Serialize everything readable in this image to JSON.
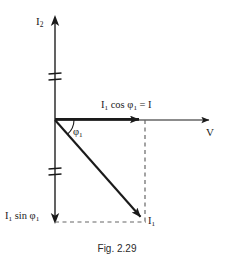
{
  "figure": {
    "caption": "Fig. 2.29",
    "background_color": "#ffffff",
    "line_color": "#1a1a1a",
    "dash_color": "#555555",
    "width": 234,
    "height": 268
  },
  "axes": {
    "vertical": {
      "label": "I₂",
      "label_base": "I",
      "label_sub": "2",
      "name": "current-axis",
      "origin_x": 55,
      "top_y": 17,
      "bottom_y": 222,
      "has_up_arrow": true,
      "has_down_arrow": true,
      "break_marks": [
        74,
        79,
        168,
        174
      ]
    },
    "horizontal": {
      "label": "V",
      "name": "voltage-axis",
      "origin_x": 55,
      "origin_y": 120,
      "end_x": 212,
      "has_arrow": true
    }
  },
  "vectors": [
    {
      "name": "i1-cos-phi1-component",
      "label_base": "I",
      "label_sub": "1",
      "label": "I₁ cos φ₁ = I",
      "from": [
        55,
        120
      ],
      "to": [
        145,
        120
      ]
    },
    {
      "name": "i1-phasor",
      "label_base": "I",
      "label_sub": "1",
      "label": "I₁",
      "from": [
        55,
        120
      ],
      "to": [
        145,
        222
      ]
    }
  ],
  "labels": {
    "i2_axis": "I",
    "i2_axis_sub": "2",
    "v_axis": "V",
    "i1_cos_phi1_prefix": "I",
    "i1_cos_phi1_sub1": "1",
    "i1_cos_phi1_mid": " cos φ",
    "i1_cos_phi1_sub2": "1",
    "i1_cos_phi1_suffix": " = I",
    "phi1_symbol": "φ",
    "phi1_sub": "1",
    "i1_sin_phi1_prefix": "I",
    "i1_sin_phi1_sub1": "1",
    "i1_sin_phi1_mid": " sin φ",
    "i1_sin_phi1_sub2": "1",
    "i1_vector": "I",
    "i1_vector_sub": "1"
  },
  "annotations": {
    "angle_arc": {
      "name": "phi1-angle-arc",
      "center": [
        55,
        120
      ],
      "radius": 19,
      "start_angle_deg": 0,
      "end_angle_deg": -48.6
    },
    "dashed_vertical": {
      "x": 145,
      "y1": 120,
      "y2": 222
    },
    "dashed_horizontal": {
      "y": 222,
      "x1": 55,
      "x2": 145
    }
  }
}
